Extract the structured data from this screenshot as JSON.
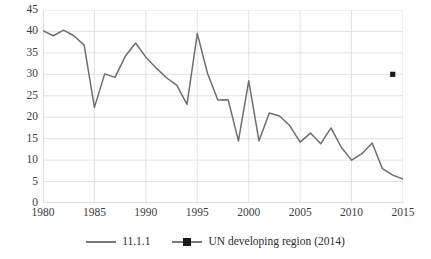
{
  "chart_data": {
    "type": "line",
    "title": "",
    "xlabel": "",
    "ylabel": "",
    "xlim": [
      1980,
      2015
    ],
    "ylim": [
      0,
      45
    ],
    "ytick_labels": [
      "0",
      "5",
      "10",
      "15",
      "20",
      "25",
      "30",
      "35",
      "40",
      "45"
    ],
    "yticks": [
      0,
      5,
      10,
      15,
      20,
      25,
      30,
      35,
      40,
      45
    ],
    "xtick_labels": [
      "1980",
      "1985",
      "1990",
      "1995",
      "2000",
      "2005",
      "2010",
      "2015"
    ],
    "xticks": [
      1980,
      1985,
      1990,
      1995,
      2000,
      2005,
      2010,
      2015
    ],
    "grid": true,
    "legend_position": "bottom",
    "x": [
      1980,
      1981,
      1982,
      1983,
      1984,
      1985,
      1986,
      1987,
      1988,
      1989,
      1990,
      1991,
      1992,
      1993,
      1994,
      1995,
      1996,
      1997,
      1998,
      1999,
      2000,
      2001,
      2002,
      2003,
      2004,
      2005,
      2006,
      2007,
      2008,
      2009,
      2010,
      2011,
      2012,
      2013,
      2014,
      2015
    ],
    "series": [
      {
        "name": "11.1.1",
        "color": "#6e6e6e",
        "marker": "none",
        "values": [
          40.2,
          39.0,
          40.3,
          39.0,
          36.8,
          22.3,
          30.1,
          29.3,
          34.2,
          37.3,
          34.0,
          31.5,
          29.2,
          27.5,
          23.0,
          39.5,
          30.2,
          24.0,
          24.1,
          14.5,
          28.5,
          14.5,
          21.0,
          20.3,
          18.0,
          14.2,
          16.3,
          13.8,
          17.5,
          13.0,
          10.0,
          11.5,
          14.0,
          8.0,
          6.5,
          5.6
        ]
      },
      {
        "name": "UN developing region (2014)",
        "color": "#1a1a1a",
        "marker": "square",
        "points": [
          {
            "x": 2014,
            "y": 30.0
          }
        ]
      }
    ]
  },
  "legend": {
    "entries": [
      {
        "label": "11.1.1",
        "style": "line"
      },
      {
        "label": "UN developing region (2014)",
        "style": "line-marker"
      }
    ]
  },
  "colors": {
    "line": "#6e6e6e",
    "marker": "#1a1a1a",
    "grid": "#e2e2e2",
    "axis": "#cccccc",
    "text": "#3c3c3c"
  }
}
